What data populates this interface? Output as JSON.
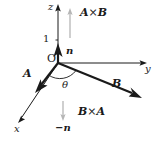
{
  "figure": {
    "background_color": "#ffffff",
    "ink_color": "#1a1a1a",
    "ghost_color": "#b0b0b0",
    "width": 159,
    "height": 143
  },
  "axes": {
    "z": {
      "label": "z",
      "x": 48,
      "y": 2
    },
    "y": {
      "label": "y",
      "x": 145,
      "y": 68
    },
    "x": {
      "label": "x",
      "x": 14,
      "y": 124
    }
  },
  "origin": {
    "label": "O",
    "x": 47,
    "y": 54
  },
  "ticks": [
    {
      "label": "1",
      "x": 43,
      "y": 34
    }
  ],
  "vectors": [
    {
      "name": "n-unit-vector",
      "label": "n",
      "label_x": 66,
      "label_y": 46,
      "style": "bold"
    },
    {
      "name": "vector-a",
      "label": "A",
      "label_x": 23,
      "label_y": 69,
      "style": "bold"
    },
    {
      "name": "vector-b",
      "label": "B",
      "label_x": 112,
      "label_y": 79,
      "style": "bold"
    },
    {
      "name": "negative-n-vector",
      "label": "−n",
      "label_x": 57,
      "label_y": 124,
      "style": "bold"
    }
  ],
  "angle": {
    "label": "θ",
    "x": 62,
    "y": 81
  },
  "cross_products": [
    {
      "name": "a-cross-b",
      "text": "A×B",
      "lhs": "A",
      "op": "×",
      "rhs": "B",
      "x": 80,
      "y": 8,
      "direction": "up"
    },
    {
      "name": "b-cross-a",
      "text": "B×A",
      "lhs": "B",
      "op": "×",
      "rhs": "A",
      "x": 78,
      "y": 107,
      "direction": "down"
    }
  ]
}
